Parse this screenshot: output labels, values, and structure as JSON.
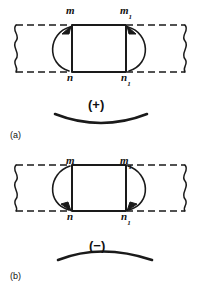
{
  "figure": {
    "stroke_color": "#1a1a1a",
    "background_color": "#ffffff"
  },
  "panels": [
    {
      "tag": "(a)",
      "sign": "(+)",
      "sign_meaning": "positive bending moment",
      "curvature": "concave-up",
      "arrow_direction": "upward-at-top",
      "labels": {
        "top_left": "m",
        "top_left_sub": "",
        "top_right": "m",
        "top_right_sub": "1",
        "bottom_left": "n",
        "bottom_left_sub": "",
        "bottom_right": "n",
        "bottom_right_sub": "1"
      }
    },
    {
      "tag": "(b)",
      "sign": "(−)",
      "sign_meaning": "negative bending moment",
      "curvature": "concave-down",
      "arrow_direction": "downward-at-bottom",
      "labels": {
        "top_left": "m",
        "top_left_sub": "",
        "top_right": "m",
        "top_right_sub": "1",
        "bottom_left": "n",
        "bottom_left_sub": "",
        "bottom_right": "n",
        "bottom_right_sub": "1"
      }
    }
  ]
}
